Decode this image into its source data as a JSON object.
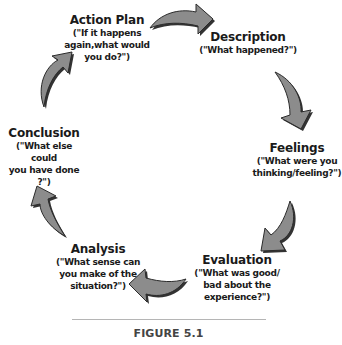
{
  "figure": {
    "caption": "FIGURE 5.1",
    "type": "cycle-diagram",
    "arrow_color": "#8c8c8c",
    "arrow_outline": "#2b2b2b"
  },
  "nodes": [
    {
      "id": "action-plan",
      "title": "Action Plan",
      "lines": [
        "(\"If it happens",
        "again,what would",
        "you do?\")"
      ]
    },
    {
      "id": "description",
      "title": "Description",
      "lines": [
        "(\"What happened?\")"
      ]
    },
    {
      "id": "feelings",
      "title": "Feelings",
      "lines": [
        "(\"What were you",
        "thinking/feeling?\")"
      ]
    },
    {
      "id": "evaluation",
      "title": "Evaluation",
      "lines": [
        "(\"What was good/",
        "bad about the",
        "experience?\")"
      ]
    },
    {
      "id": "analysis",
      "title": "Analysis",
      "lines": [
        "(\"What sense can",
        "you make of the",
        "situation?\")"
      ]
    },
    {
      "id": "conclusion",
      "title": "Conclusion",
      "lines": [
        "(\"What else could",
        "you have done ?\")"
      ]
    }
  ],
  "arrows": [
    {
      "from": "action-plan",
      "to": "description",
      "direction": "right"
    },
    {
      "from": "description",
      "to": "feelings",
      "direction": "down"
    },
    {
      "from": "feelings",
      "to": "evaluation",
      "direction": "down-left"
    },
    {
      "from": "evaluation",
      "to": "analysis",
      "direction": "left"
    },
    {
      "from": "analysis",
      "to": "conclusion",
      "direction": "up"
    },
    {
      "from": "conclusion",
      "to": "action-plan",
      "direction": "up-right"
    }
  ]
}
